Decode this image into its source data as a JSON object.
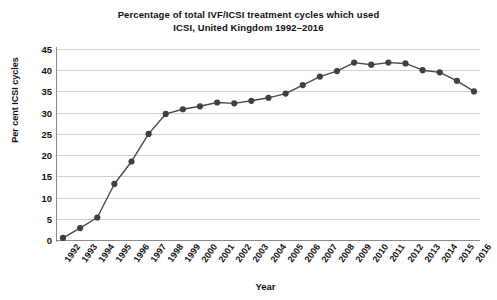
{
  "chart_data": {
    "type": "line",
    "title": "Percentage of total IVF/ICSI treatment cycles which used ICSI, United Kingdom 1992–2016",
    "title_lines": [
      "Percentage of total IVF/ICSI treatment cycles which used",
      "ICSI, United Kingdom 1992–2016"
    ],
    "xlabel": "Year",
    "ylabel": "Per cent ICSI cycles",
    "ylim": [
      0,
      45
    ],
    "yticks": [
      0,
      5,
      10,
      15,
      20,
      25,
      30,
      35,
      40,
      45
    ],
    "ytick_labels": [
      "0",
      "5",
      "10",
      "15",
      "20",
      "25",
      "30",
      "35",
      "40",
      "45"
    ],
    "grid": true,
    "legend": null,
    "legend_position": "none",
    "marker": "circle",
    "line_color": "#4a4a4a",
    "marker_color": "#404040",
    "categories": [
      "1992",
      "1993",
      "1994",
      "1995",
      "1996",
      "1997",
      "1998",
      "1999",
      "2000",
      "2001",
      "2002",
      "2003",
      "2004",
      "2005",
      "2006",
      "2007",
      "2008",
      "2009",
      "2010",
      "2011",
      "2012",
      "2013",
      "2014",
      "2015",
      "2016"
    ],
    "values": [
      0.5,
      2.8,
      5.3,
      13.2,
      18.5,
      25.0,
      29.7,
      30.8,
      31.5,
      32.4,
      32.2,
      32.8,
      33.5,
      34.5,
      36.5,
      38.5,
      39.8,
      41.8,
      41.3,
      41.8,
      41.6,
      40.0,
      39.5,
      37.5,
      35.0
    ],
    "series": [
      {
        "name": "Per cent ICSI cycles",
        "values": [
          0.5,
          2.8,
          5.3,
          13.2,
          18.5,
          25.0,
          29.7,
          30.8,
          31.5,
          32.4,
          32.2,
          32.8,
          33.5,
          34.5,
          36.5,
          38.5,
          39.8,
          41.8,
          41.3,
          41.8,
          41.6,
          40.0,
          39.5,
          37.5,
          35.0
        ]
      }
    ]
  }
}
